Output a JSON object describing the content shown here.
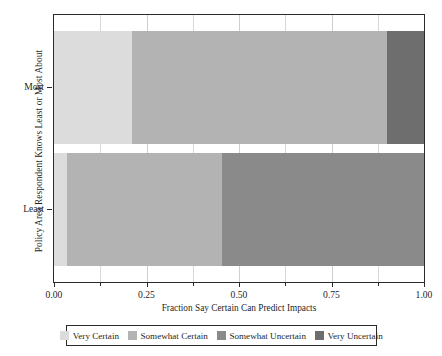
{
  "chart_data": {
    "type": "bar",
    "orientation": "horizontal",
    "stacked": true,
    "normalized": true,
    "title": "",
    "xlabel": "Fraction Say Certain Can Predict Impacts",
    "ylabel": "Policy Area Respondent Knows Least or Most About",
    "xlim": [
      0.0,
      1.0
    ],
    "xticks": [
      0.0,
      0.25,
      0.5,
      0.75,
      1.0
    ],
    "xticklabels": [
      "0.00",
      "0.25",
      "0.50",
      "0.75",
      "1.00"
    ],
    "xminorticks": [
      0.125,
      0.375,
      0.625,
      0.875
    ],
    "categories": [
      "Most",
      "Least"
    ],
    "grid": "vertical",
    "legend_position": "bottom",
    "series": [
      {
        "name": "Very Certain",
        "color": "#dcdcdc",
        "values": [
          0.21,
          0.035
        ]
      },
      {
        "name": "Somewhat Certain",
        "color": "#b3b3b3",
        "values": [
          0.69,
          0.42
        ]
      },
      {
        "name": "Somewhat Uncertain",
        "color": "#8a8a8a",
        "values": [
          0.0,
          0.545
        ]
      },
      {
        "name": "Very Uncertain",
        "color": "#6e6e6e",
        "values": [
          0.1,
          0.0
        ]
      }
    ],
    "bars": [
      {
        "category": "Most",
        "segments": [
          {
            "label": "Very Certain",
            "start": 0.0,
            "end": 0.21,
            "value": 0.21
          },
          {
            "label": "Somewhat Certain",
            "start": 0.21,
            "end": 0.9,
            "value": 0.69
          },
          {
            "label": "Very Uncertain",
            "start": 0.9,
            "end": 1.0,
            "value": 0.1
          }
        ]
      },
      {
        "category": "Least",
        "segments": [
          {
            "label": "Very Certain",
            "start": 0.0,
            "end": 0.035,
            "value": 0.035
          },
          {
            "label": "Somewhat Certain",
            "start": 0.035,
            "end": 0.455,
            "value": 0.42
          },
          {
            "label": "Somewhat Uncertain",
            "start": 0.455,
            "end": 1.0,
            "value": 0.545
          }
        ]
      }
    ]
  },
  "axis": {
    "ylabel": "Policy Area Respondent Knows Least or Most About",
    "xlabel": "Fraction Say Certain Can Predict Impacts",
    "ytick_most": "Most",
    "ytick_least": "Least",
    "xtick_0": "0.00",
    "xtick_1": "0.25",
    "xtick_2": "0.50",
    "xtick_3": "0.75",
    "xtick_4": "1.00"
  },
  "legend": {
    "items": [
      {
        "label": "Very Certain",
        "color": "#dcdcdc"
      },
      {
        "label": "Somewhat Certain",
        "color": "#b3b3b3"
      },
      {
        "label": "Somewhat Uncertain",
        "color": "#8a8a8a"
      },
      {
        "label": "Very Uncertain",
        "color": "#6e6e6e"
      }
    ]
  },
  "colors": {
    "frame": "#2b2b2b",
    "grid": "#d9d9d9",
    "background": "#ffffff",
    "text": "#1f1f1f"
  }
}
